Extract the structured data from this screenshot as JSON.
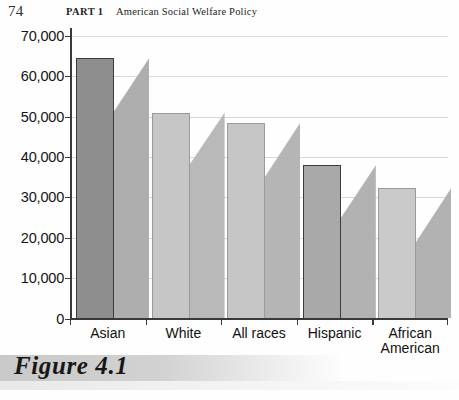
{
  "page": {
    "folio": "74",
    "part_label": "PART 1",
    "book_title": "American Social Welfare Policy"
  },
  "figure": {
    "caption": "Figure 4.1"
  },
  "chart_data": {
    "type": "bar",
    "title": "",
    "xlabel": "",
    "ylabel": "",
    "ylim": [
      0,
      70000
    ],
    "ytick_values": [
      0,
      10000,
      20000,
      30000,
      40000,
      50000,
      60000,
      70000
    ],
    "ytick_labels": [
      "0",
      "10,000",
      "20,000",
      "30,000",
      "40,000",
      "50,000",
      "60,000",
      "70,000"
    ],
    "grid": true,
    "legend": "none",
    "categories": [
      "Asian",
      "White",
      "All races",
      "Hispanic",
      "African American"
    ],
    "values": [
      64500,
      51000,
      48500,
      38000,
      32400
    ],
    "shadow_values": [
      51000,
      37800,
      34800,
      24500,
      18700
    ],
    "bar_colors": [
      "#8e8e8e",
      "#c6c6c6",
      "#c6c6c6",
      "#a9a9a9",
      "#cacaca"
    ],
    "shadow_colors": [
      "#aeaeae",
      "#b9b9b9",
      "#b5b5b5",
      "#b2b2b2",
      "#b2b2b2"
    ]
  }
}
